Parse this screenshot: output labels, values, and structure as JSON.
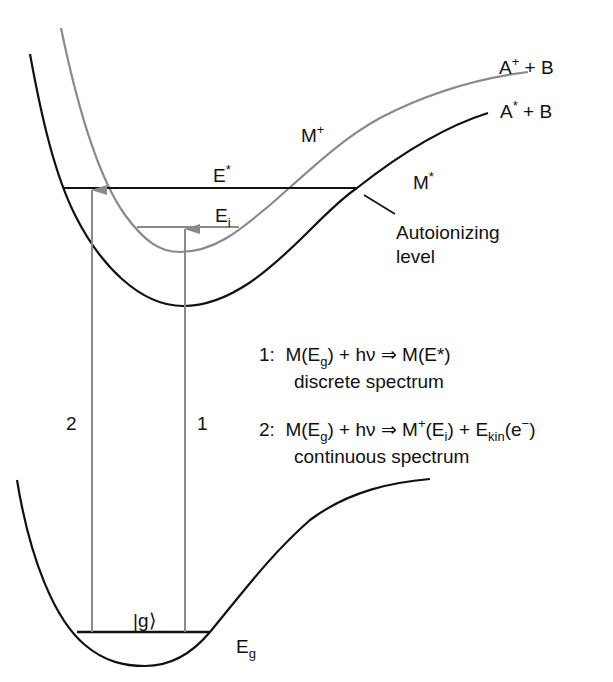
{
  "diagram": {
    "colors": {
      "neutral_curve": "#111111",
      "ion_curve": "#8a8a8a",
      "arrow": "#8a8a8a"
    },
    "curves": {
      "excited_neutral": {
        "label_base": "M",
        "label_sup": "*",
        "asymptote": {
          "base": "A",
          "sup": "*",
          "rest": " + B"
        }
      },
      "ion": {
        "label_base": "M",
        "label_sup": "+",
        "asymptote": {
          "base": "A",
          "sup": "+",
          "rest": " + B"
        }
      },
      "ground": {
        "state_label": "|g⟩",
        "energy_base": "E",
        "energy_sub": "g"
      }
    },
    "levels": {
      "e_star": {
        "base": "E",
        "sup": "*"
      },
      "e_i": {
        "base": "E",
        "sub": "i"
      }
    },
    "autoionizing": {
      "line1": "Autoionizing",
      "line2": "level"
    },
    "arrows": {
      "arrow1_label": "1",
      "arrow2_label": "2"
    },
    "equations": [
      {
        "num": "1:",
        "lhs_m": "M(E",
        "lhs_sub": "g",
        "lhs_close": ")",
        "plus_hv": " + hν ⇒ ",
        "rhs": "M(E*)",
        "caption": "discrete spectrum"
      },
      {
        "num": "2:",
        "lhs_m": "M(E",
        "lhs_sub": "g",
        "lhs_close": ")",
        "plus_hv": " + hν ⇒ ",
        "rhs_m": "M",
        "rhs_sup": "+",
        "rhs_open": "(E",
        "rhs_sub": "i",
        "rhs_close": ") + E",
        "ekin_sub": "kin",
        "ekin_open": "(e",
        "ekin_sup": "−",
        "ekin_close": ")",
        "caption": "continuous spectrum"
      }
    ]
  }
}
